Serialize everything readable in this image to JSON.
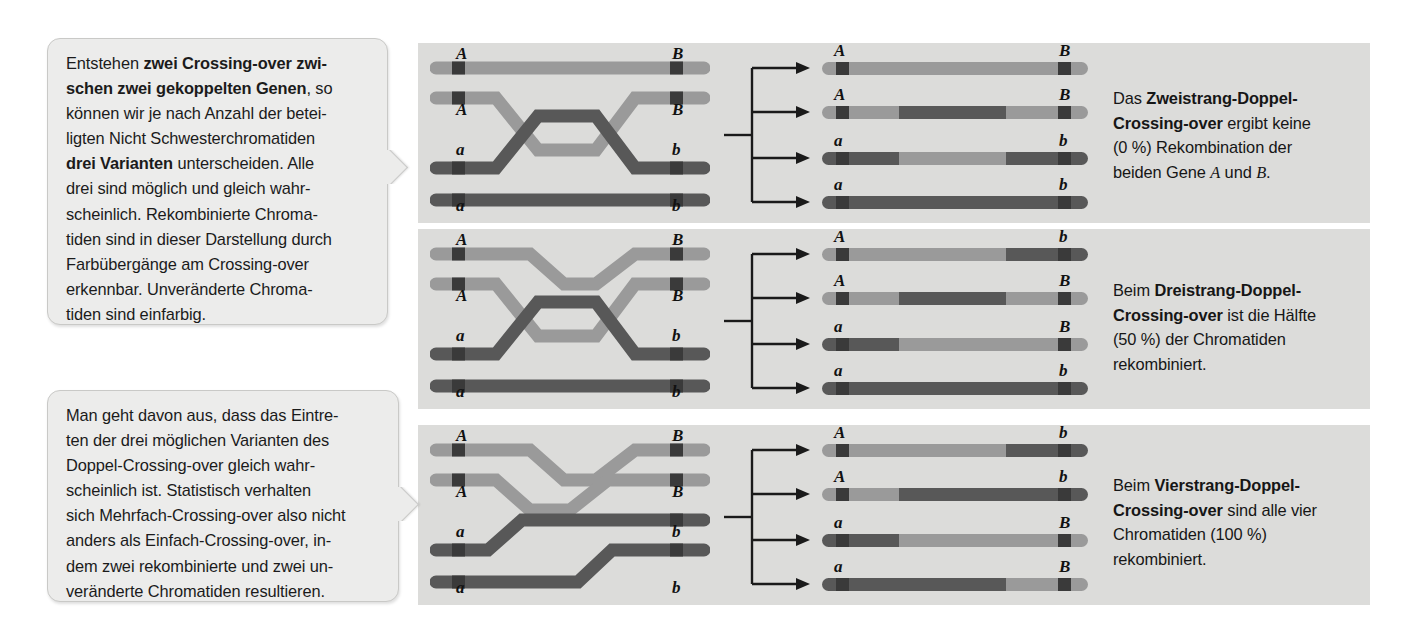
{
  "callouts": [
    {
      "name": "callout-left-top",
      "lines": [
        {
          "text": "Entstehen ",
          "bold": false
        },
        {
          "text": "zwei Crossing-over zwi-",
          "bold": true
        },
        {
          "text": "\n",
          "bold": false
        },
        {
          "text": "schen zwei gekoppelten Genen",
          "bold": true
        },
        {
          "text": ", so\nkönnen wir je nach Anzahl der betei-\nligten Nicht Schwesterchromatiden\n",
          "bold": false
        },
        {
          "text": "drei Varianten",
          "bold": true
        },
        {
          "text": " unterscheiden. Alle\ndrei sind möglich und gleich wahr-\nscheinlich. Rekombinierte Chroma-\ntiden sind in dieser Darstellung durch\nFarbübergänge am Crossing-over\nerkennbar. Unveränderte Chroma-\ntiden sind einfarbig.",
          "bold": false
        }
      ]
    },
    {
      "name": "callout-left-bottom",
      "lines": [
        {
          "text": "Man geht davon aus, dass das Eintre-\nten der drei möglichen Varianten des\nDoppel-Crossing-over gleich wahr-\nscheinlich ist. Statistisch verhalten\nsich Mehrfach-Crossing-over also nicht\nanders als Einfach-Crossing-over, in-\ndem zwei rekombinierte und zwei un-\nveränderte Chromatiden resultieren.",
          "bold": false
        }
      ]
    }
  ],
  "captions": [
    {
      "name": "caption-zweistrang",
      "parts": [
        {
          "text": "Das ",
          "style": "normal"
        },
        {
          "text": "Zweistrang-Doppel-\nCrossing-over",
          "style": "bold"
        },
        {
          "text": " ergibt keine\n(0 %) Rekombination der\nbeiden Gene ",
          "style": "normal"
        },
        {
          "text": "A",
          "style": "italic"
        },
        {
          "text": " und ",
          "style": "normal"
        },
        {
          "text": "B",
          "style": "italic"
        },
        {
          "text": ".",
          "style": "normal"
        }
      ]
    },
    {
      "name": "caption-dreistrang",
      "parts": [
        {
          "text": "Beim ",
          "style": "normal"
        },
        {
          "text": "Dreistrang-Doppel-\nCrossing-over",
          "style": "bold"
        },
        {
          "text": " ist die Hälfte\n(50 %) der Chromatiden\nrekombiniert.",
          "style": "normal"
        }
      ]
    },
    {
      "name": "caption-vierstrang",
      "parts": [
        {
          "text": "Beim ",
          "style": "normal"
        },
        {
          "text": "Vierstrang-Doppel-\nCrossing-over",
          "style": "bold"
        },
        {
          "text": " sind alle vier\nChromatiden (100 %)\nrekombiniert.",
          "style": "normal"
        }
      ]
    }
  ],
  "colors": {
    "light_chromatid": "#9a9a9a",
    "dark_chromatid": "#585858",
    "gene_marker": "#3a3a3a",
    "panel_background": "#dcdcda",
    "callout_background": "#ececeb",
    "callout_border": "#c9c9c7",
    "page_background": "#ffffff",
    "arrow": "#1a1a1a"
  },
  "panels": [
    {
      "name": "panel-zweistrang",
      "variant": "Zweistrang-Doppel-Crossing-over",
      "recombination_percent": "0 %",
      "left_alleles_top": [
        "A",
        "A",
        "a",
        "a"
      ],
      "left_alleles_bottom": [
        "B",
        "B",
        "b",
        "b"
      ],
      "right_alleles_left": [
        "A",
        "A",
        "a",
        "a"
      ],
      "right_alleles_right": [
        "B",
        "B",
        "b",
        "b"
      ],
      "crossing_strands": [
        2,
        3
      ],
      "products": [
        {
          "left_allele": "A",
          "right_allele": "B",
          "recombinant": false,
          "segments": [
            [
              "light",
              0,
              100
            ]
          ]
        },
        {
          "left_allele": "A",
          "right_allele": "B",
          "recombinant": true,
          "segments": [
            [
              "light",
              0,
              29
            ],
            [
              "dark",
              29,
              69
            ],
            [
              "light",
              69,
              100
            ]
          ]
        },
        {
          "left_allele": "a",
          "right_allele": "b",
          "recombinant": true,
          "segments": [
            [
              "dark",
              0,
              29
            ],
            [
              "light",
              29,
              69
            ],
            [
              "dark",
              69,
              100
            ]
          ]
        },
        {
          "left_allele": "a",
          "right_allele": "b",
          "recombinant": false,
          "segments": [
            [
              "dark",
              0,
              100
            ]
          ]
        }
      ]
    },
    {
      "name": "panel-dreistrang",
      "variant": "Dreistrang-Doppel-Crossing-over",
      "recombination_percent": "50 %",
      "left_alleles_top": [
        "A",
        "A",
        "a",
        "a"
      ],
      "left_alleles_bottom": [
        "B",
        "B",
        "b",
        "b"
      ],
      "right_alleles_left": [
        "A",
        "A",
        "a",
        "a"
      ],
      "right_alleles_right": [
        "b",
        "B",
        "B",
        "b"
      ],
      "crossing_strands": [
        1,
        2,
        3
      ],
      "products": [
        {
          "left_allele": "A",
          "right_allele": "b",
          "recombinant": true,
          "segments": [
            [
              "light",
              0,
              69
            ],
            [
              "dark",
              69,
              100
            ]
          ]
        },
        {
          "left_allele": "A",
          "right_allele": "B",
          "recombinant": true,
          "segments": [
            [
              "light",
              0,
              29
            ],
            [
              "dark",
              29,
              69
            ],
            [
              "light",
              69,
              100
            ]
          ]
        },
        {
          "left_allele": "a",
          "right_allele": "B",
          "recombinant": true,
          "segments": [
            [
              "dark",
              0,
              29
            ],
            [
              "light",
              29,
              100
            ]
          ]
        },
        {
          "left_allele": "a",
          "right_allele": "b",
          "recombinant": false,
          "segments": [
            [
              "dark",
              0,
              100
            ]
          ]
        }
      ]
    },
    {
      "name": "panel-vierstrang",
      "variant": "Vierstrang-Doppel-Crossing-over",
      "recombination_percent": "100 %",
      "left_alleles_top": [
        "A",
        "A",
        "a",
        "a"
      ],
      "left_alleles_bottom": [
        "B",
        "B",
        "b",
        "b"
      ],
      "right_alleles_left": [
        "A",
        "A",
        "a",
        "a"
      ],
      "right_alleles_right": [
        "b",
        "b",
        "B",
        "B"
      ],
      "crossing_strands": [
        1,
        2,
        3,
        4
      ],
      "products": [
        {
          "left_allele": "A",
          "right_allele": "b",
          "recombinant": true,
          "segments": [
            [
              "light",
              0,
              69
            ],
            [
              "dark",
              69,
              100
            ]
          ]
        },
        {
          "left_allele": "A",
          "right_allele": "b",
          "recombinant": true,
          "segments": [
            [
              "light",
              0,
              29
            ],
            [
              "dark",
              29,
              100
            ]
          ]
        },
        {
          "left_allele": "a",
          "right_allele": "B",
          "recombinant": true,
          "segments": [
            [
              "dark",
              0,
              29
            ],
            [
              "light",
              29,
              100
            ]
          ]
        },
        {
          "left_allele": "a",
          "right_allele": "B",
          "recombinant": true,
          "segments": [
            [
              "dark",
              0,
              69
            ],
            [
              "light",
              69,
              100
            ]
          ]
        }
      ]
    }
  ]
}
